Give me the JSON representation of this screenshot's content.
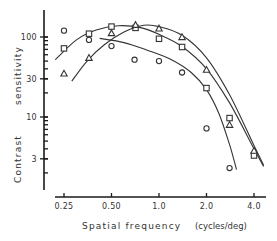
{
  "chart_data": {
    "type": "line",
    "title": "",
    "xlabel": "Spatial frequency",
    "xlabel_unit": "(cycles/deg)",
    "ylabel_parts": [
      "Contrast",
      "sensitivity"
    ],
    "ylabel": "Contrast sensitivity",
    "xscale": "log",
    "yscale": "log",
    "xlim": [
      0.2,
      4.5
    ],
    "ylim": [
      1.8,
      180
    ],
    "grid": false,
    "legend": null,
    "x_ticks": [
      {
        "value": 0.25,
        "label": "0.25"
      },
      {
        "value": 0.5,
        "label": "0.50"
      },
      {
        "value": 1.0,
        "label": "1.0"
      },
      {
        "value": 2.0,
        "label": "2.0"
      },
      {
        "value": 4.0,
        "label": "4.0"
      }
    ],
    "y_ticks": [
      {
        "value": 100,
        "label": "100"
      },
      {
        "value": 30,
        "label": "30"
      },
      {
        "value": 10,
        "label": "10"
      },
      {
        "value": 3,
        "label": "3"
      }
    ],
    "series": [
      {
        "name": "circles",
        "marker": "circle",
        "x": [
          0.25,
          0.36,
          0.5,
          0.7,
          1.0,
          1.4,
          2.0,
          2.8
        ],
        "values": [
          120,
          92,
          77,
          52,
          50,
          36,
          7.2,
          2.3
        ],
        "fit_curve": {
          "x": [
            0.42,
            0.6,
            0.85,
            1.2,
            1.6,
            2.0,
            2.4,
            2.8,
            3.1
          ],
          "values": [
            96,
            85,
            68,
            52,
            36,
            22,
            11,
            4.5,
            2.2
          ]
        }
      },
      {
        "name": "squares",
        "marker": "square",
        "x": [
          0.25,
          0.36,
          0.5,
          0.71,
          1.0,
          1.4,
          2.0,
          2.8,
          4.0
        ],
        "values": [
          72,
          110,
          135,
          130,
          95,
          75,
          23,
          9.7,
          3.3
        ],
        "fit_curve": {
          "x": [
            0.22,
            0.3,
            0.4,
            0.55,
            0.75,
            1.0,
            1.4,
            2.0,
            2.8,
            4.0,
            4.6
          ],
          "values": [
            52,
            92,
            122,
            138,
            132,
            108,
            76,
            40,
            15,
            4,
            2.4
          ]
        }
      },
      {
        "name": "triangles",
        "marker": "triangle",
        "x": [
          0.25,
          0.36,
          0.5,
          0.71,
          1.0,
          1.4,
          2.0,
          2.8,
          4.0
        ],
        "values": [
          35,
          55,
          112,
          142,
          128,
          100,
          39,
          8,
          3.8
        ],
        "fit_curve": {
          "x": [
            0.28,
            0.35,
            0.45,
            0.6,
            0.8,
            1.0,
            1.4,
            2.0,
            2.8,
            4.0,
            4.6
          ],
          "values": [
            28,
            50,
            80,
            115,
            140,
            135,
            105,
            55,
            19,
            4.4,
            2.5
          ]
        }
      }
    ]
  },
  "colors": {
    "ink": "#333333",
    "background": "#ffffff"
  }
}
